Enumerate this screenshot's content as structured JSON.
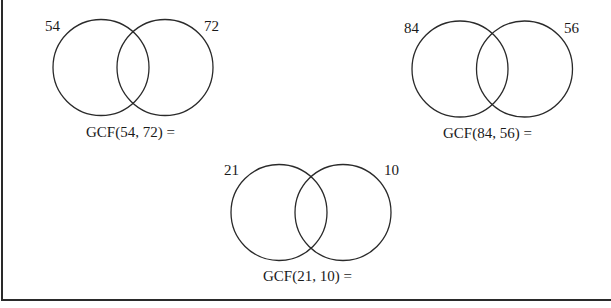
{
  "worksheet": {
    "problems": [
      {
        "left_number": "54",
        "right_number": "72",
        "equation": "GCF(54, 72) ="
      },
      {
        "left_number": "84",
        "right_number": "56",
        "equation": "GCF(84, 56) ="
      },
      {
        "left_number": "21",
        "right_number": "10",
        "equation": "GCF(21, 10) ="
      }
    ]
  }
}
